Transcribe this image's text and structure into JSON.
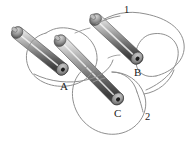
{
  "figure": {
    "type": "physics-diagram",
    "background_color": "#ffffff",
    "rods": [
      {
        "id": "rod-a",
        "label": "A",
        "label_x": 60,
        "label_y": 81,
        "start_x": 16,
        "start_y": 33,
        "end_x": 62,
        "end_y": 69,
        "radius": 6.5,
        "body_light": "#e8e8e8",
        "body_mid": "#9a9a9a",
        "body_dark": "#3a3a3a",
        "cap_color": "#8e8e8e",
        "bore_color": "#1a1a1a"
      },
      {
        "id": "rod-c",
        "label": "C",
        "label_x": 114,
        "label_y": 108,
        "start_x": 58,
        "start_y": 41,
        "end_x": 118,
        "end_y": 100,
        "radius": 6.5,
        "body_light": "#e8e8e8",
        "body_mid": "#9a9a9a",
        "body_dark": "#3a3a3a",
        "cap_color": "#8e8e8e",
        "bore_color": "#1a1a1a"
      },
      {
        "id": "rod-b",
        "label": "B",
        "label_x": 134,
        "label_y": 67,
        "start_x": 94,
        "start_y": 20,
        "end_x": 137,
        "end_y": 59,
        "radius": 6.5,
        "body_light": "#e8e8e8",
        "body_mid": "#9a9a9a",
        "body_dark": "#3a3a3a",
        "cap_color": "#8e8e8e",
        "bore_color": "#1a1a1a"
      }
    ],
    "wire": {
      "color": "#8a8a8a",
      "width": 1,
      "labels": [
        {
          "id": "wire-label-1",
          "text": "1",
          "x": 124,
          "y": 5
        },
        {
          "id": "wire-label-2",
          "text": "2",
          "x": 145,
          "y": 112
        }
      ]
    }
  }
}
